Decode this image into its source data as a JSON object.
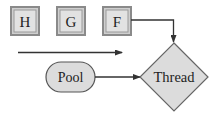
{
  "diagram": {
    "queue_boxes": [
      {
        "label": "H",
        "x": 11,
        "y": 7,
        "w": 28,
        "h": 28
      },
      {
        "label": "G",
        "x": 57,
        "y": 7,
        "w": 28,
        "h": 28
      },
      {
        "label": "F",
        "x": 103,
        "y": 7,
        "w": 28,
        "h": 28
      }
    ],
    "pool": {
      "label": "Pool",
      "x": 46,
      "y": 62,
      "w": 49,
      "h": 30
    },
    "thread": {
      "label": "Thread",
      "cx": 174,
      "cy": 77,
      "rx": 34,
      "ry": 34
    },
    "colors": {
      "box_fill": "#dcdcdc",
      "box_border": "#888888",
      "stroke": "#333333",
      "text": "#222222"
    }
  }
}
